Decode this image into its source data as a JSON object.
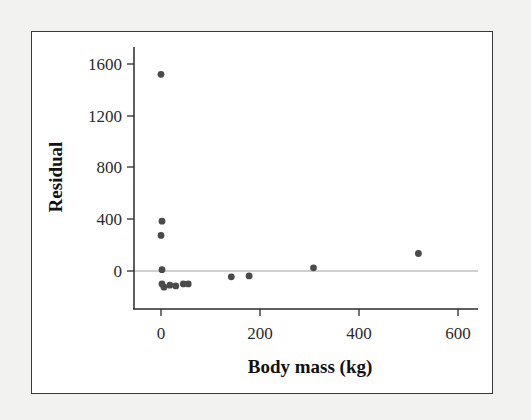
{
  "chart_data": {
    "type": "scatter",
    "title": "",
    "xlabel": "Body mass (kg)",
    "ylabel": "Residual",
    "xlim": [
      -50,
      650
    ],
    "ylim": [
      -300,
      1750
    ],
    "xticks": [
      0,
      200,
      400,
      600
    ],
    "yticks": [
      0,
      400,
      800,
      1200,
      1600
    ],
    "xtick_labels": [
      "0",
      "200",
      "400",
      "600"
    ],
    "ytick_labels": [
      "0",
      "400",
      "800",
      "1200",
      "1600"
    ],
    "grid": false,
    "legend": null,
    "reference_line": {
      "y": 0,
      "color": "#9a9a9a"
    },
    "point_color": "#4a4a4a",
    "points": [
      {
        "x": 0,
        "y": 1520
      },
      {
        "x": 2,
        "y": 385
      },
      {
        "x": 0,
        "y": 275
      },
      {
        "x": 2,
        "y": 10
      },
      {
        "x": 2,
        "y": -100
      },
      {
        "x": 6,
        "y": -125
      },
      {
        "x": 18,
        "y": -110
      },
      {
        "x": 30,
        "y": -115
      },
      {
        "x": 45,
        "y": -100
      },
      {
        "x": 55,
        "y": -100
      },
      {
        "x": 142,
        "y": -45
      },
      {
        "x": 178,
        "y": -38
      },
      {
        "x": 308,
        "y": 25
      },
      {
        "x": 520,
        "y": 135
      }
    ]
  },
  "axes": {
    "x_title": "Body mass (kg)",
    "y_title": "Residual",
    "x_ticks": [
      "0",
      "200",
      "400",
      "600"
    ],
    "y_ticks": [
      "1600",
      "1200",
      "800",
      "400",
      "0"
    ]
  }
}
